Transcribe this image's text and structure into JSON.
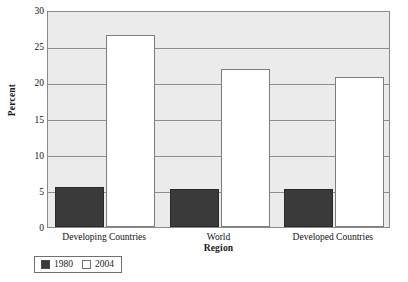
{
  "chart_data": {
    "type": "bar",
    "title": "",
    "xlabel": "Region",
    "ylabel": "Percent",
    "categories": [
      "Developing Countries",
      "World",
      "Developed Countries"
    ],
    "series": [
      {
        "name": "1980",
        "values": [
          5.6,
          5.2,
          5.2
        ],
        "color": "#3a3a3a"
      },
      {
        "name": "2004",
        "values": [
          26.5,
          21.8,
          20.7
        ],
        "color": "#ffffff"
      }
    ],
    "ylim": [
      0,
      30
    ],
    "yticks": [
      0,
      5,
      10,
      15,
      20,
      25,
      30
    ],
    "ytick_labels": [
      "0",
      "5",
      "10",
      "15",
      "20",
      "25",
      "30"
    ],
    "grid": true,
    "legend_position": "below-left",
    "plot_background": "#ebebeb"
  },
  "legend": {
    "entries": [
      {
        "label": "1980",
        "style": "dark"
      },
      {
        "label": "2004",
        "style": "light"
      }
    ]
  }
}
